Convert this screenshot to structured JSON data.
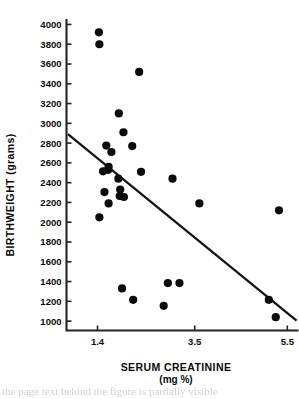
{
  "chart_data": {
    "type": "scatter",
    "title": "",
    "xlabel": "SERUM  CREATININE",
    "xlabel_units": "(mg %)",
    "ylabel": "BIRTHWEIGHT (grams)",
    "xlim": [
      0.73,
      5.72
    ],
    "ylim": [
      905,
      4045
    ],
    "xticks": [
      1.4,
      3.5,
      5.5
    ],
    "xtick_labels": [
      "1.4",
      "3.5",
      "5.5"
    ],
    "yticks": [
      1000,
      1200,
      1400,
      1600,
      1800,
      2000,
      2200,
      2400,
      2600,
      2800,
      3000,
      3200,
      3400,
      3600,
      3800,
      4000
    ],
    "ytick_labels": [
      "1000",
      "1200",
      "1400",
      "1600",
      "1800",
      "2000",
      "2200",
      "2400",
      "2600",
      "2800",
      "3000",
      "3200",
      "3400",
      "3600",
      "3800",
      "4000"
    ],
    "grid": false,
    "legend": null,
    "marker_color": "#0b0b0b",
    "line_color": "#141414",
    "axis_color": "#232323",
    "points": [
      {
        "x": 1.43,
        "y": 3920
      },
      {
        "x": 1.44,
        "y": 3800
      },
      {
        "x": 2.3,
        "y": 3520
      },
      {
        "x": 1.86,
        "y": 3100
      },
      {
        "x": 1.96,
        "y": 2910
      },
      {
        "x": 1.59,
        "y": 2775
      },
      {
        "x": 2.15,
        "y": 2770
      },
      {
        "x": 1.7,
        "y": 2710
      },
      {
        "x": 1.64,
        "y": 2560
      },
      {
        "x": 1.63,
        "y": 2530
      },
      {
        "x": 1.52,
        "y": 2515
      },
      {
        "x": 2.34,
        "y": 2510
      },
      {
        "x": 1.85,
        "y": 2440
      },
      {
        "x": 3.02,
        "y": 2440
      },
      {
        "x": 1.89,
        "y": 2330
      },
      {
        "x": 1.55,
        "y": 2305
      },
      {
        "x": 1.88,
        "y": 2265
      },
      {
        "x": 1.97,
        "y": 2255
      },
      {
        "x": 1.64,
        "y": 2190
      },
      {
        "x": 3.6,
        "y": 2190
      },
      {
        "x": 5.32,
        "y": 2120
      },
      {
        "x": 1.44,
        "y": 2050
      },
      {
        "x": 2.92,
        "y": 1385
      },
      {
        "x": 3.17,
        "y": 1385
      },
      {
        "x": 1.93,
        "y": 1330
      },
      {
        "x": 5.1,
        "y": 1215
      },
      {
        "x": 2.17,
        "y": 1215
      },
      {
        "x": 2.83,
        "y": 1155
      },
      {
        "x": 5.25,
        "y": 1040
      }
    ],
    "fit_line": {
      "x_start": 0.76,
      "y_start": 2890,
      "x_end": 5.7,
      "y_end": 1005
    }
  },
  "footer": {
    "text": "the page text behind the figure is partially visible"
  }
}
